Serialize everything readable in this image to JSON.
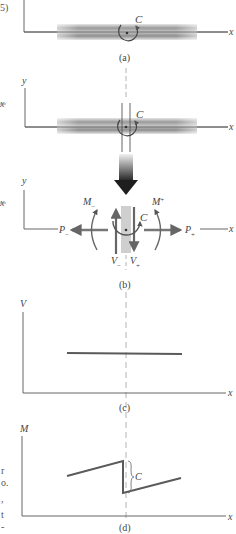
{
  "figure": {
    "edge_fragments": {
      "top_left": "5)",
      "x_left_a": "x",
      "x_left_b": "x",
      "left_text": [
        "r",
        "o.",
        ",",
        "t",
        "-"
      ]
    },
    "panels": [
      {
        "id": "a",
        "caption": "(a)",
        "labels": {
          "x_axis": "x",
          "couple": "C"
        }
      },
      {
        "id": "a2",
        "caption": "",
        "labels": {
          "y_axis": "y",
          "x_axis": "x",
          "couple": "C"
        }
      },
      {
        "id": "b",
        "caption": "(b)",
        "labels": {
          "y_axis": "y",
          "x_axis": "x",
          "couple": "C",
          "moment_left": "M",
          "moment_left_sub": "−",
          "moment_right": "M",
          "moment_right_sub": "+",
          "axial_left": "P",
          "axial_left_sub": "−",
          "axial_right": "P",
          "axial_right_sub": "+",
          "shear_left": "V",
          "shear_left_sub": "−",
          "shear_right": "V",
          "shear_right_sub": "+"
        }
      },
      {
        "id": "c",
        "caption": "(c)",
        "labels": {
          "y_axis": "V",
          "x_axis": "x"
        }
      },
      {
        "id": "d",
        "caption": "(d)",
        "labels": {
          "y_axis": "M",
          "x_axis": "x",
          "jump": "C"
        }
      }
    ]
  },
  "colors": {
    "line": "#555555",
    "beam_dark": "#7a7a7a",
    "beam_light": "#d8d8d8",
    "plot_line": "#5a5a5a",
    "dashed": "#aaaaaa",
    "arrow_dark": "#222222"
  }
}
